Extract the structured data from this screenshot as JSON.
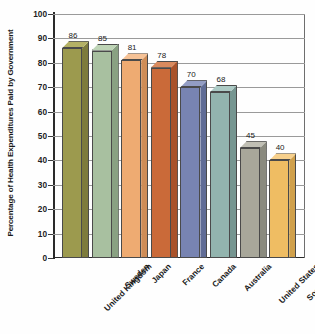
{
  "chart_data": {
    "type": "bar",
    "title": "",
    "subtitle": "",
    "xlabel": "",
    "ylabel": "Percentage of Health Expenditures Paid by Government",
    "ylim": [
      0,
      100
    ],
    "ytick_step": 10,
    "yticks": [
      "100",
      "90",
      "80",
      "70",
      "60",
      "50",
      "40",
      "30",
      "20",
      "10",
      "0"
    ],
    "grid": true,
    "legend": "none",
    "style": "3d-bar",
    "categories": [
      "United Kingdom",
      "Sweden",
      "Japan",
      "France",
      "Canada",
      "Australia",
      "United States",
      "South Africa"
    ],
    "values": [
      86,
      85,
      81,
      78,
      70,
      68,
      45,
      40
    ],
    "value_labels": [
      "86",
      "85",
      "81",
      "78",
      "70",
      "68",
      "45",
      "40"
    ],
    "colors": [
      "#9c9a4e",
      "#a8c0a0",
      "#eeab72",
      "#ca6a39",
      "#7884b2",
      "#92b4ae",
      "#a8a79a",
      "#efbd63"
    ],
    "side_colors": [
      "#7d7b3c",
      "#89a182",
      "#cf8d57",
      "#a9522a",
      "#606c96",
      "#769691",
      "#8a8a7e",
      "#d0a04b"
    ],
    "top_colors": [
      "#b4b165",
      "#bed4b6",
      "#f6c296",
      "#d98a5e",
      "#939dc4",
      "#accac5",
      "#c0bfb4",
      "#f7d08c"
    ]
  }
}
